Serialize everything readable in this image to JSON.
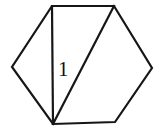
{
  "figure": {
    "background_color": "#ffffff",
    "stroke_color": "#161616",
    "stroke_width": 2.2,
    "canvas": {
      "width": 160,
      "height": 130
    },
    "outline": {
      "name": "hexagon",
      "closed": true,
      "points": [
        {
          "name": "top-left-vertex",
          "x": 52,
          "y": 6
        },
        {
          "name": "top-right-vertex",
          "x": 114,
          "y": 6
        },
        {
          "name": "right-vertex",
          "x": 152,
          "y": 68
        },
        {
          "name": "bottom-right-vertex",
          "x": 115,
          "y": 122
        },
        {
          "name": "bottom-left-vertex",
          "x": 53,
          "y": 124
        },
        {
          "name": "left-vertex",
          "x": 12,
          "y": 67
        }
      ],
      "points_attr": "52,6 114,6 152,68 115,122 53,124 12,67"
    },
    "internal_segments": [
      {
        "name": "vertical-chord",
        "from": "top-left-vertex",
        "to": "bottom-left-vertex",
        "x1": 52,
        "y1": 6,
        "x2": 53,
        "y2": 124
      },
      {
        "name": "diagonal-chord",
        "from": "bottom-left-vertex",
        "to": "top-right-vertex",
        "x1": 53,
        "y1": 124,
        "x2": 114,
        "y2": 6
      }
    ],
    "labels": [
      {
        "name": "region-label-1",
        "text": "1",
        "x": 58,
        "y": 59,
        "font_size": 21,
        "color": "#111111"
      }
    ]
  }
}
